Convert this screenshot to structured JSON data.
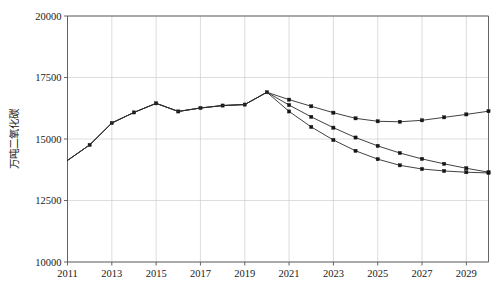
{
  "chart_data": {
    "type": "line",
    "title": "",
    "xlabel": "",
    "ylabel": "万吨二氧化碳",
    "xlim": [
      2011,
      2030
    ],
    "ylim": [
      10000,
      20000
    ],
    "grid": true,
    "legend": "none",
    "y_ticks": [
      10000,
      12500,
      15000,
      17500,
      20000
    ],
    "y_tick_labels": [
      "10000",
      "12500",
      "15000",
      "17500",
      "20000"
    ],
    "x_ticks": [
      2011,
      2013,
      2015,
      2017,
      2019,
      2021,
      2023,
      2025,
      2027,
      2029
    ],
    "x_tick_labels": [
      "2011",
      "2013",
      "2015",
      "2017",
      "2019",
      "2021",
      "2023",
      "2025",
      "2027",
      "2029"
    ],
    "x_gridlines": [
      2011,
      2013,
      2015,
      2017,
      2019,
      2021,
      2023,
      2025,
      2027,
      2029
    ],
    "x": [
      2011,
      2012,
      2013,
      2014,
      2015,
      2016,
      2017,
      2018,
      2019,
      2020,
      2021,
      2022,
      2023,
      2024,
      2025,
      2026,
      2027,
      2028,
      2029,
      2030
    ],
    "series": [
      {
        "name": "历史与基准情景",
        "marker": "square",
        "values": [
          14130,
          14760,
          15650,
          16080,
          16450,
          16120,
          16260,
          16360,
          16400,
          16900,
          16600,
          16330,
          16070,
          15840,
          15720,
          15700,
          15760,
          15880,
          16000,
          16130
        ]
      },
      {
        "name": "历史与政策情景",
        "marker": "square",
        "values": [
          14130,
          14760,
          15650,
          16080,
          16450,
          16120,
          16260,
          16360,
          16400,
          16900,
          16380,
          15900,
          15460,
          15060,
          14720,
          14430,
          14190,
          13990,
          13810,
          13650
        ]
      },
      {
        "name": "历史与强化情景",
        "marker": "square",
        "values": [
          14130,
          14760,
          15650,
          16080,
          16450,
          16120,
          16260,
          16360,
          16400,
          16900,
          16120,
          15490,
          14960,
          14520,
          14180,
          13930,
          13780,
          13700,
          13650,
          13620
        ]
      }
    ],
    "series_colors": [
      "#2b2b2b",
      "#2b2b2b",
      "#2b2b2b"
    ],
    "historical_end_year": 2020
  },
  "axes": {
    "ylabel": "万吨二氧化碳"
  }
}
